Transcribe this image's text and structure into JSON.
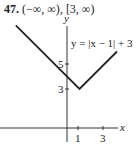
{
  "header": {
    "number": "47.",
    "domain": "(−∞, ∞)",
    "separator": ",",
    "range": "[3, ∞)"
  },
  "chart_data": {
    "type": "line",
    "title": "",
    "xlabel": "x",
    "ylabel": "y",
    "equation_label": "y = |x − 1| + 3",
    "x_ticks": [
      1,
      3
    ],
    "y_ticks": [
      3,
      5
    ],
    "x_tick_labels": [
      "1",
      "3"
    ],
    "y_tick_labels": [
      "3",
      "5"
    ],
    "series": [
      {
        "name": "y = |x − 1| + 3",
        "x": [
          -4.1,
          1,
          4.0
        ],
        "y": [
          8.1,
          3,
          6.0
        ]
      }
    ],
    "vertex": [
      1,
      3
    ],
    "grid": false,
    "legend": "none"
  }
}
